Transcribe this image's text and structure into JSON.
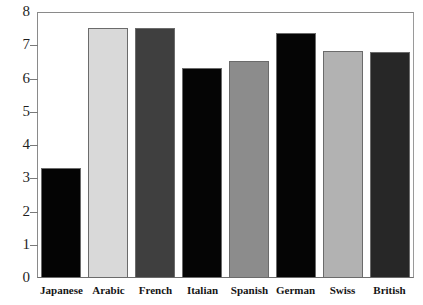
{
  "chart_data": {
    "type": "bar",
    "title": "",
    "xlabel": "",
    "ylabel": "",
    "categories": [
      "Japanese",
      "Arabic",
      "French",
      "Italian",
      "Spanish",
      "German",
      "Swiss",
      "British"
    ],
    "values": [
      3.32,
      7.52,
      7.52,
      6.33,
      6.52,
      7.37,
      6.82,
      6.8
    ],
    "bar_colors": [
      "#040404",
      "#d9d9d9",
      "#3f3f3f",
      "#050505",
      "#8c8c8c",
      "#050505",
      "#b2b2b2",
      "#272727"
    ],
    "ylim": [
      0,
      8
    ],
    "yticks": [
      0,
      1,
      2,
      3,
      4,
      5,
      6,
      7,
      8
    ],
    "ytick_labels": [
      "0",
      "1",
      "2",
      "3",
      "4",
      "5",
      "6",
      "7",
      "8"
    ],
    "grid": false,
    "legend": "none",
    "series": [
      {
        "name": "value",
        "values": [
          3.32,
          7.52,
          7.52,
          6.33,
          6.52,
          7.37,
          6.82,
          6.8
        ]
      }
    ]
  },
  "axes": {
    "frame_color": "#7a7a7a",
    "tick_color": "#7a7a7a",
    "label_color": "#1f1f1f"
  }
}
